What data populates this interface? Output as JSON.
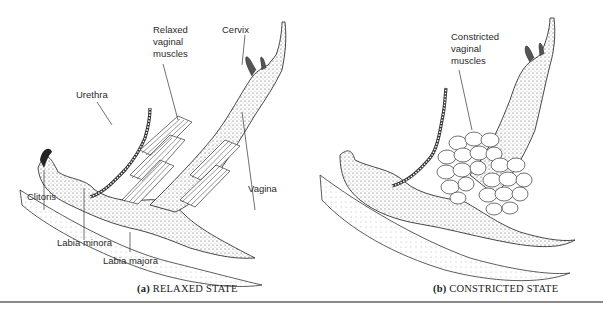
{
  "panels": [
    {
      "id": "a",
      "caption_letter": "(a)",
      "caption_text": "RELAXED STATE",
      "labels": {
        "relaxed_muscles_1": "Relaxed",
        "relaxed_muscles_2": "vaginal",
        "relaxed_muscles_3": "muscles",
        "cervix": "Cervix",
        "urethra": "Urethra",
        "clitoris": "Clitoris",
        "vagina": "Vagina",
        "labia_minora": "Labia minora",
        "labia_majora": "Labia majora"
      }
    },
    {
      "id": "b",
      "caption_letter": "(b)",
      "caption_text": "CONSTRICTED STATE",
      "labels": {
        "constricted_muscles_1": "Constricted",
        "constricted_muscles_2": "vaginal",
        "constricted_muscles_3": "muscles"
      }
    }
  ],
  "colors": {
    "ink": "#222222",
    "rule": "#8a8a8a",
    "background": "#ffffff"
  }
}
